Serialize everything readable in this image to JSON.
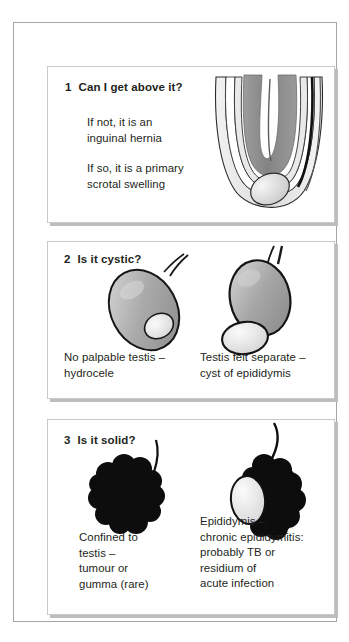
{
  "document": {
    "title": "Scrotal swelling examination algorithm",
    "panel_count": 3
  },
  "colors": {
    "page_background": "#ffffff",
    "frame_border": "#a6a6a6",
    "panel_border": "#c9c9c9",
    "panel_shadow": "#bdbdbd",
    "text": "#231f20",
    "bowel_gray": "#8a8a8a",
    "organ_gray": "#a8a8a8",
    "pale_gray": "#e2e2e2",
    "solid_black": "#0d0d0d",
    "outline": "#1a1a1a"
  },
  "panels": [
    {
      "number": "1",
      "question": "Can I get above it?",
      "texts": [
        "If not, it is an\ninguinal hernia",
        "If so, it is a primary\nscrotal swelling"
      ],
      "figures": [
        {
          "name": "inguinal-hernia-diagram",
          "description": "Bowel loop descending into layered scrotal sac with testis at base"
        }
      ]
    },
    {
      "number": "2",
      "question": "Is it cystic?",
      "figures": [
        {
          "name": "hydrocele-diagram",
          "caption": "No palpable testis –\nhydrocele"
        },
        {
          "name": "epididymal-cyst-diagram",
          "caption": "Testis felt separate –\ncyst of epididymis"
        }
      ]
    },
    {
      "number": "3",
      "question": "Is it solid?",
      "figures": [
        {
          "name": "testicular-tumour-diagram",
          "caption": "Confined to\ntestis –\ntumour or\ngumma (rare)"
        },
        {
          "name": "chronic-epididymitis-diagram",
          "caption": "Epididymis –\nchronic epididymitis:\nprobably TB or\nresidium of\nacute infection"
        }
      ]
    }
  ]
}
